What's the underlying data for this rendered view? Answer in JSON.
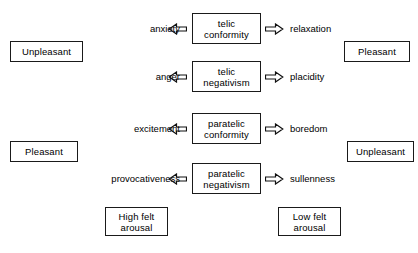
{
  "diagram": {
    "type": "state-emotion-diagram",
    "colors": {
      "background": "#ffffff",
      "stroke": "#1a1a1a",
      "text": "#000000"
    },
    "states": [
      {
        "id": "telic-conformity",
        "line1": "telic",
        "line2": "conformity",
        "left_emotion": "anxiety",
        "right_emotion": "relaxation",
        "left_arrow": "double-arrow-left",
        "right_arrow": "double-arrow-right"
      },
      {
        "id": "telic-negativism",
        "line1": "telic",
        "line2": "negativism",
        "left_emotion": "anger",
        "right_emotion": "placidity",
        "left_arrow": "double-arrow-left",
        "right_arrow": "double-arrow-right"
      },
      {
        "id": "paratelic-conformity",
        "line1": "paratelic",
        "line2": "conformity",
        "left_emotion": "excitement",
        "right_emotion": "boredom",
        "left_arrow": "double-arrow-left",
        "right_arrow": "double-arrow-right"
      },
      {
        "id": "paratelic-negativism",
        "line1": "paratelic",
        "line2": "negativism",
        "left_emotion": "provocativeness",
        "right_emotion": "sullenness",
        "left_arrow": "double-arrow-left",
        "right_arrow": "double-arrow-right"
      }
    ],
    "corner_labels": [
      {
        "id": "upper-left",
        "text": "Unpleasant"
      },
      {
        "id": "upper-right",
        "text": "Pleasant"
      },
      {
        "id": "lower-left",
        "text": "Pleasant"
      },
      {
        "id": "lower-right",
        "text": "Unpleasant"
      }
    ],
    "arousal_labels": [
      {
        "id": "high-arousal",
        "line1": "High felt",
        "line2": "arousal"
      },
      {
        "id": "low-arousal",
        "line1": "Low felt",
        "line2": "arousal"
      }
    ]
  }
}
